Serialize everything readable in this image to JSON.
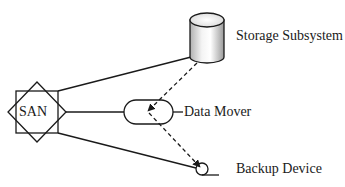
{
  "diagram": {
    "type": "san-serverless-backup",
    "nodes": [
      {
        "id": "san",
        "label": "SAN",
        "shape": "square-and-diamond"
      },
      {
        "id": "storage",
        "label": "Storage Subsystem",
        "shape": "cylinder"
      },
      {
        "id": "mover",
        "label": "Data Mover",
        "shape": "rounded-pill"
      },
      {
        "id": "backup",
        "label": "Backup Device",
        "shape": "tape-reel"
      }
    ],
    "edges": [
      {
        "from": "san",
        "to": "storage",
        "style": "solid"
      },
      {
        "from": "san",
        "to": "mover",
        "style": "solid"
      },
      {
        "from": "san",
        "to": "backup",
        "style": "solid"
      },
      {
        "from": "storage",
        "to": "mover",
        "style": "dashed",
        "arrow": true
      },
      {
        "from": "mover",
        "to": "backup",
        "style": "dashed",
        "arrow": true
      }
    ]
  },
  "labels": {
    "san": "SAN",
    "storage": "Storage Subsystem",
    "mover": "Data Mover",
    "backup": "Backup Device"
  },
  "colors": {
    "stroke": "#1a1a1a",
    "cylinder_light": "#ffffff",
    "cylinder_dark": "#a8a8a8"
  }
}
